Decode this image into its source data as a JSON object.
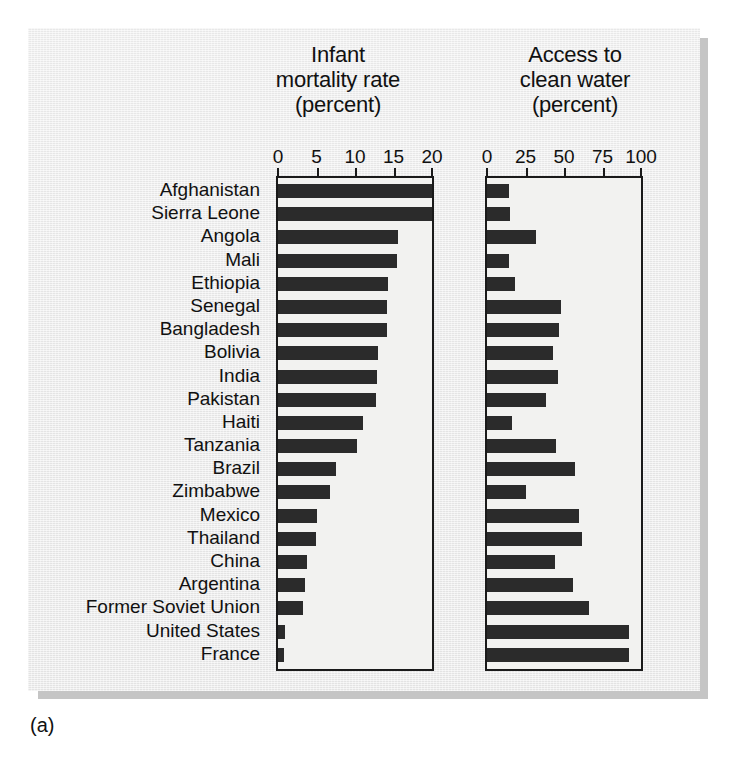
{
  "caption": "(a)",
  "charts": [
    {
      "id": "infant-mortality",
      "title": "Infant\nmortality rate\n(percent)",
      "axis_ticks": [
        0,
        5,
        10,
        15,
        20
      ],
      "axis_tick_labels": [
        "0",
        "5",
        "10",
        "15",
        "20"
      ]
    },
    {
      "id": "clean-water",
      "title": "Access to\nclean water\n(percent)",
      "axis_ticks": [
        0,
        25,
        50,
        75,
        100
      ],
      "axis_tick_labels": [
        "0",
        "25",
        "50",
        "75",
        "100"
      ]
    }
  ],
  "chart_data": {
    "type": "bar",
    "orientation": "horizontal",
    "categories": [
      "Afghanistan",
      "Sierra Leone",
      "Angola",
      "Mali",
      "Ethiopia",
      "Senegal",
      "Bangladesh",
      "Bolivia",
      "India",
      "Pakistan",
      "Haiti",
      "Tanzania",
      "Brazil",
      "Zimbabwe",
      "Mexico",
      "Thailand",
      "China",
      "Argentina",
      "Former Soviet Union",
      "United States",
      "France"
    ],
    "series": [
      {
        "name": "Infant mortality rate (percent)",
        "xlabel": "Infant mortality rate (percent)",
        "xlim": [
          0,
          20
        ],
        "ticks": [
          0,
          5,
          10,
          15,
          20
        ],
        "values": [
          20.0,
          20.0,
          15.6,
          15.5,
          14.3,
          14.2,
          14.1,
          13.0,
          12.8,
          12.7,
          11.0,
          10.2,
          7.5,
          6.7,
          5.1,
          4.9,
          3.8,
          3.5,
          3.2,
          0.9,
          0.8
        ]
      },
      {
        "name": "Access to clean water (percent)",
        "xlabel": "Access to clean water (percent)",
        "xlim": [
          0,
          100
        ],
        "ticks": [
          0,
          25,
          50,
          75,
          100
        ],
        "values": [
          14,
          15,
          32,
          14,
          18,
          48,
          47,
          43,
          46,
          38,
          16,
          45,
          57,
          25,
          60,
          62,
          44,
          56,
          66,
          92,
          92
        ]
      }
    ],
    "grid": false,
    "legend": false,
    "bar_color": "#2b2b2b"
  },
  "colors": {
    "bar": "#2b2b2b",
    "panel_background": "#ebebeb",
    "plot_background": "#f2f2f0",
    "axis": "#1a1a1a",
    "text": "#111111"
  }
}
